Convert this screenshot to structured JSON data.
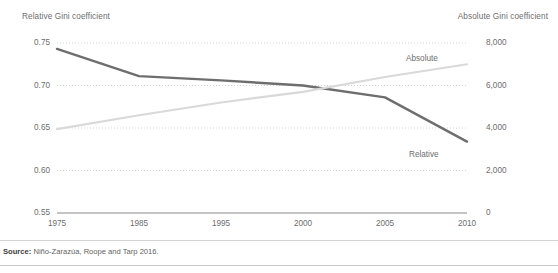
{
  "chart_data": {
    "type": "line",
    "title": "",
    "xlabel": "",
    "grid": true,
    "legend_position": "inline-end-of-line",
    "x": [
      "1975",
      "1985",
      "1995",
      "2000",
      "2005",
      "2010"
    ],
    "categories": [
      "1975",
      "1985",
      "1995",
      "2000",
      "2005",
      "2010"
    ],
    "xtick_labels": [
      "1975",
      "1985",
      "1995",
      "2000",
      "2005",
      "2010"
    ],
    "axes": {
      "left": {
        "label": "Relative Gini coefficient",
        "ylim": [
          0.55,
          0.75
        ],
        "ticks": [
          0.75,
          0.7,
          0.65,
          0.6,
          0.55
        ],
        "tick_labels": [
          "0.75",
          "0.70",
          "0.65",
          "0.60",
          "0.55"
        ]
      },
      "right": {
        "label": "Absolute Gini coefficient",
        "ylim": [
          0,
          8000
        ],
        "ticks": [
          8000,
          6000,
          4000,
          2000,
          0
        ],
        "tick_labels": [
          "8,000",
          "6,000",
          "4,000",
          "2,000",
          "0"
        ]
      }
    },
    "series": [
      {
        "name": "Relative",
        "label": "Relative",
        "axis": "left",
        "color": "#6e6e6e",
        "values": [
          0.743,
          0.711,
          0.706,
          0.7,
          0.686,
          0.634
        ]
      },
      {
        "name": "Absolute",
        "label": "Absolute",
        "axis": "right",
        "color": "#d9d9d9",
        "values": [
          3950,
          4600,
          5200,
          5700,
          6400,
          7000
        ]
      }
    ]
  },
  "footer": {
    "source_prefix": "Source:",
    "source_text": "Niño-Zarazúa, Roope and Tarp 2016."
  }
}
